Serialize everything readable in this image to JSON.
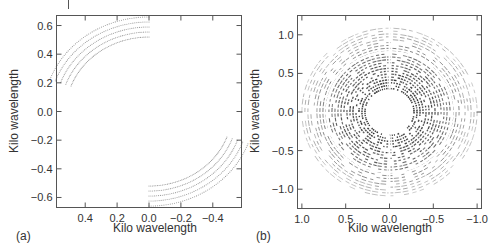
{
  "chart_data": [
    {
      "type": "scatter",
      "panel_label": "(a)",
      "title": "",
      "xlabel": "Kilo wavelength",
      "ylabel": "Kilo wavelength",
      "xlim": [
        0.58,
        -0.58
      ],
      "ylim": [
        -0.67,
        0.67
      ],
      "x_ticks": [
        "0.4",
        "0.2",
        "0.0",
        "−0.2",
        "−0.4"
      ],
      "x_tick_values": [
        0.4,
        0.2,
        0.0,
        -0.2,
        -0.4
      ],
      "y_ticks": [
        "0.6",
        "0.4",
        "0.2",
        "0.0",
        "−0.2",
        "−0.4",
        "−0.6"
      ],
      "y_tick_values": [
        0.6,
        0.4,
        0.2,
        0.0,
        -0.2,
        -0.4,
        -0.6
      ],
      "grid": false,
      "description": "Two symmetric bands of dotted uv-track arcs: one in the upper-right (u from 0 to -0.55, v from 0.2 to 0.65) and its mirror in the lower-left (u from 0.55 to 0, v from -0.2 to -0.65).",
      "series": [
        {
          "name": "track band (upper)",
          "radii": [
            0.52,
            0.555,
            0.59,
            0.625,
            0.66
          ],
          "angle_range_deg": [
            90,
            160
          ],
          "color": "#999999"
        },
        {
          "name": "track band (lower, conjugate)",
          "radii": [
            0.52,
            0.555,
            0.59,
            0.625,
            0.66
          ],
          "angle_range_deg": [
            270,
            340
          ],
          "color": "#999999"
        }
      ]
    },
    {
      "type": "scatter",
      "panel_label": "(b)",
      "title": "",
      "xlabel": "Kilo wavelength",
      "ylabel": "Kilo wavelength",
      "xlim": [
        1.05,
        -1.05
      ],
      "ylim": [
        -1.25,
        1.25
      ],
      "x_ticks": [
        "1.0",
        "0.5",
        "0.0",
        "−0.5",
        "−1.0"
      ],
      "x_tick_values": [
        1.0,
        0.5,
        0.0,
        -0.5,
        -1.0
      ],
      "y_ticks": [
        "1.0",
        "0.5",
        "0.0",
        "−0.5",
        "−1.0"
      ],
      "y_tick_values": [
        1.0,
        0.5,
        0.0,
        -0.5,
        -1.0
      ],
      "grid": false,
      "description": "Full elliptical uv-coverage: concentric dashed elliptical tracks from about 0.25 to 1.05 kilo-wavelength, densest near the inner ring, with a central hole and radial gaps.",
      "series": [
        {
          "name": "elliptical tracks",
          "semi_major_range": [
            0.28,
            1.0
          ],
          "axis_ratio": 1.18,
          "track_count": 22,
          "color": "#222222"
        }
      ]
    }
  ]
}
